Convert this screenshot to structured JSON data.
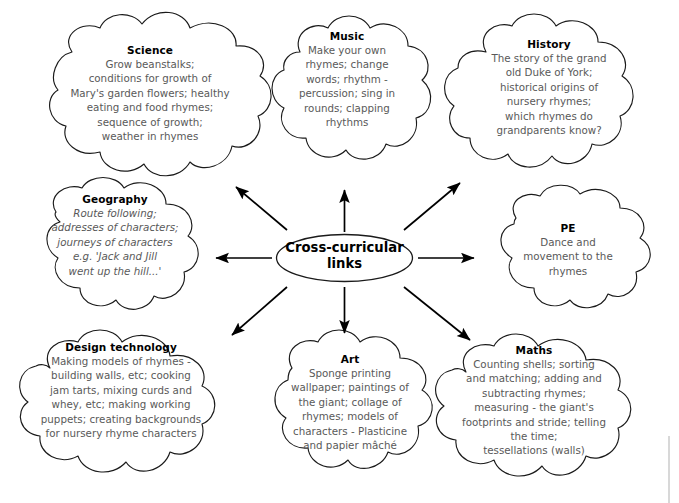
{
  "diagram": {
    "type": "mind-map",
    "center": {
      "label": "Cross-curricular links",
      "line1": "Cross-curricular",
      "line2": "links",
      "shape": "ellipse"
    },
    "branch_count": 8,
    "colors": {
      "background": "#ffffff",
      "outline": "#1a1a1a",
      "title_text": "#000000",
      "body_text": "#595959",
      "arrow": "#000000"
    },
    "nodes": [
      {
        "id": "science",
        "title": "Science",
        "body": "Grow beanstalks; conditions for growth of Mary's garden flowers; healthy eating and food rhymes; sequence of growth; weather in rhymes",
        "lines": [
          "Grow beanstalks;",
          "conditions for growth of",
          "Mary's garden flowers; healthy",
          "eating and food rhymes;",
          "sequence of growth;",
          "weather in rhymes"
        ],
        "position": "top-left",
        "italic": false
      },
      {
        "id": "music",
        "title": "Music",
        "body": "Make your own rhymes; change words; rhythm - percussion; sing in rounds; clapping rhythms",
        "lines": [
          "Make your own",
          "rhymes; change",
          "words; rhythm -",
          "percussion; sing in",
          "rounds; clapping",
          "rhythms"
        ],
        "position": "top-center",
        "italic": false
      },
      {
        "id": "history",
        "title": "History",
        "body": "The story of the grand old Duke of York; historical origins of nursery rhymes; which rhymes do grandparents know?",
        "lines": [
          "The story of the grand",
          "old Duke of York;",
          "historical origins of",
          "nursery rhymes;",
          "which rhymes do",
          "grandparents know?"
        ],
        "position": "top-right",
        "italic": false
      },
      {
        "id": "geography",
        "title": "Geography",
        "body": "Route following; addresses of characters; journeys of characters e.g. 'Jack and Jill went up the hill...'",
        "lines": [
          "Route following;",
          "addresses of characters;",
          "journeys of characters",
          "e.g. 'Jack and Jill",
          "went up the hill...'"
        ],
        "position": "middle-left",
        "italic": true
      },
      {
        "id": "pe",
        "title": "PE",
        "body": "Dance and movement to the rhymes",
        "lines": [
          "Dance and",
          "movement to the",
          "rhymes"
        ],
        "position": "middle-right",
        "italic": false
      },
      {
        "id": "design-technology",
        "title": "Design technology",
        "body": "Making models of rhymes - building walls, etc; cooking jam tarts, mixing curds and whey, etc; making working puppets; creating backgrounds for nursery rhyme characters",
        "lines": [
          "Making models of rhymes -",
          "building walls, etc; cooking",
          "jam tarts, mixing curds and",
          "whey, etc; making working",
          "puppets; creating backgrounds",
          "for nursery rhyme characters"
        ],
        "position": "bottom-left",
        "italic": false
      },
      {
        "id": "art",
        "title": "Art",
        "body": "Sponge printing wallpaper; paintings of the giant; collage of rhymes; models of characters - Plasticine and papier mâché",
        "lines": [
          "Sponge printing",
          "wallpaper; paintings of",
          "the giant; collage of",
          "rhymes; models of",
          "characters - Plasticine",
          "and papier mâché"
        ],
        "position": "bottom-center",
        "italic": false
      },
      {
        "id": "maths",
        "title": "Maths",
        "body": "Counting shells; sorting and matching; adding and subtracting rhymes; measuring - the giant's footprints and stride; telling the time; tessellations (walls)",
        "lines": [
          "Counting shells; sorting",
          "and matching; adding and",
          "subtracting rhymes;",
          "measuring - the giant's",
          "footprints and stride; telling",
          "the time;",
          "tessellations (walls)"
        ],
        "position": "bottom-right",
        "italic": false
      }
    ]
  }
}
